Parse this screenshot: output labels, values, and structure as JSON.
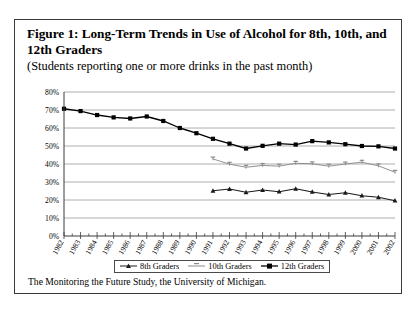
{
  "figure": {
    "title": "Figure 1: Long-Term Trends in Use of Alcohol for 8th, 10th, and 12th Graders",
    "subtitle": "(Students reporting one or more drinks in the past month)",
    "source_note": "The Monitoring the Future Study, the University of Michigan."
  },
  "legend": {
    "position": "bottom-center",
    "entries": [
      {
        "label": "8th Graders",
        "marker": "triangle-marker-icon",
        "color": "#1a1a1a"
      },
      {
        "label": "10th Graders",
        "marker": "dash-marker-icon",
        "color": "#8a8a8a"
      },
      {
        "label": "12th Graders",
        "marker": "square-marker-icon",
        "color": "#000000"
      }
    ]
  },
  "chart_data": {
    "type": "line",
    "title": "Figure 1: Long-Term Trends in Use of Alcohol for 8th, 10th, and 12th Graders",
    "subtitle": "(Students reporting one or more drinks in the past month)",
    "xlabel": "",
    "ylabel": "",
    "ylim": [
      0,
      80
    ],
    "ytick_labels": [
      "0%",
      "10%",
      "20%",
      "30%",
      "40%",
      "50%",
      "60%",
      "70%",
      "80%"
    ],
    "ytick_values": [
      0,
      10,
      20,
      30,
      40,
      50,
      60,
      70,
      80
    ],
    "grid": true,
    "categories": [
      "1982",
      "1983",
      "1984",
      "1985",
      "1986",
      "1987",
      "1988",
      "1989",
      "1990",
      "1991",
      "1992",
      "1993",
      "1994",
      "1995",
      "1996",
      "1997",
      "1998",
      "1999",
      "2000",
      "2001",
      "2002"
    ],
    "series": [
      {
        "name": "8th Graders",
        "color": "#1a1a1a",
        "marker": "triangle",
        "values": [
          null,
          null,
          null,
          null,
          null,
          null,
          null,
          null,
          null,
          25.1,
          26.1,
          24.3,
          25.5,
          24.6,
          26.2,
          24.5,
          23.0,
          24.0,
          22.4,
          21.5,
          19.6
        ]
      },
      {
        "name": "10th Graders",
        "color": "#8a8a8a",
        "marker": "dash",
        "values": [
          null,
          null,
          null,
          null,
          null,
          null,
          null,
          null,
          null,
          42.8,
          39.9,
          38.2,
          39.2,
          38.8,
          40.4,
          40.1,
          38.8,
          40.0,
          41.0,
          39.0,
          35.4
        ]
      },
      {
        "name": "12th Graders",
        "color": "#000000",
        "marker": "square",
        "values": [
          70.7,
          69.4,
          67.2,
          65.9,
          65.3,
          66.4,
          63.9,
          60.0,
          57.1,
          54.0,
          51.3,
          48.6,
          50.1,
          51.3,
          50.8,
          52.7,
          52.0,
          51.0,
          50.0,
          49.8,
          48.6
        ]
      }
    ]
  }
}
